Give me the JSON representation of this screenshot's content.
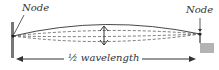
{
  "diagram": {
    "labels": {
      "left_node": "Node",
      "right_node": "Node",
      "wavelength": "½ wavelength"
    },
    "colors": {
      "stroke": "#333333",
      "post": "#777777",
      "block": "#b3b3b3"
    },
    "icons": [
      "double-arrow-icon",
      "arrow-left-icon",
      "arrow-right-icon"
    ]
  }
}
